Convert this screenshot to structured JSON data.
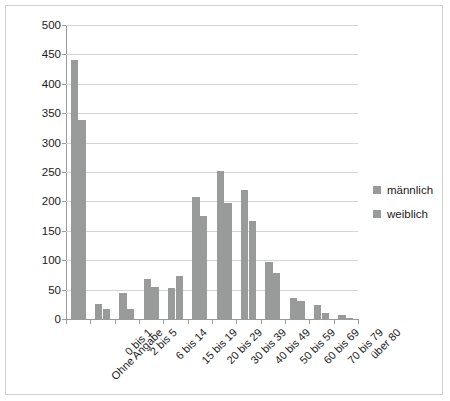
{
  "chart_data": {
    "type": "bar",
    "title": "",
    "subtitle": "",
    "xlabel": "",
    "ylabel": "",
    "ylim": [
      0,
      500
    ],
    "ytick_step": 50,
    "yticks": [
      0,
      50,
      100,
      150,
      200,
      250,
      300,
      350,
      400,
      450,
      500
    ],
    "grid": true,
    "legend_position": "right",
    "categories": [
      "Ohne Angabe",
      "0 bis 1",
      "2 bis 5",
      "6 bis 14",
      "15 bis 19",
      "20 bis 29",
      "30 bis 39",
      "40 bis 49",
      "50 bis 59",
      "60 bis 69",
      "70 bis 79",
      "über 80"
    ],
    "series": [
      {
        "name": "männlich",
        "color": "#999a9a",
        "values": [
          440,
          25,
          45,
          68,
          53,
          207,
          252,
          220,
          97,
          35,
          24,
          6
        ]
      },
      {
        "name": "weiblich",
        "color": "#999a9a",
        "values": [
          338,
          17,
          17,
          54,
          74,
          176,
          197,
          167,
          78,
          30,
          10,
          2
        ]
      }
    ]
  },
  "legend": {
    "items": [
      {
        "label": "männlich",
        "color": "#999a9a"
      },
      {
        "label": "weiblich",
        "color": "#999a9a"
      }
    ]
  },
  "colors": {
    "bar": "#999a9a",
    "gridline": "#d4d4d4",
    "axis": "#9a9a9a",
    "border": "#cfcfcf",
    "text": "#1a1a1a"
  }
}
